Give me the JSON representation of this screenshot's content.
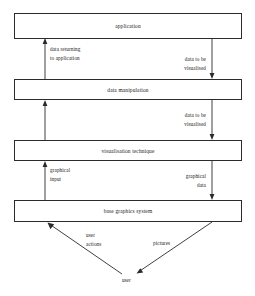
{
  "diagram": {
    "colors": {
      "stroke": "#2b2b2b",
      "text": "#1a1a1a",
      "background": "#ffffff"
    },
    "boxes": [
      {
        "id": "application",
        "label": "application"
      },
      {
        "id": "data-manipulation",
        "label": "data manipulation"
      },
      {
        "id": "visualisation-technique",
        "label": "visualisation technique"
      },
      {
        "id": "base-graphics-system",
        "label": "base graphics system"
      }
    ],
    "edge_labels": [
      {
        "id": "data-returning-to-application",
        "line1": "data returning",
        "line2": "to application"
      },
      {
        "id": "data-to-be-visualised-upper",
        "line1": "data to be",
        "line2": "visualised"
      },
      {
        "id": "data-to-be-visualised-lower",
        "line1": "data to be",
        "line2": "visualised"
      },
      {
        "id": "graphical-input",
        "line1": "graphical",
        "line2": "input"
      },
      {
        "id": "graphical-data",
        "line1": "graphical",
        "line2": "data"
      },
      {
        "id": "user-actions",
        "line1": "user",
        "line2": "actions"
      },
      {
        "id": "pictures",
        "line1": "pictures",
        "line2": ""
      }
    ],
    "nodes": [
      {
        "id": "user",
        "label": "user"
      }
    ]
  }
}
